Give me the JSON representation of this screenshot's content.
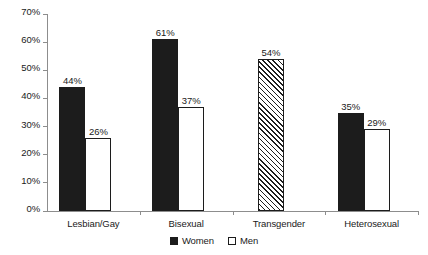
{
  "chart_data": {
    "type": "bar",
    "title": "",
    "subtitle": "",
    "xlabel": "",
    "ylabel": "",
    "categories": [
      "Lesbian/Gay",
      "Bisexual",
      "Transgender",
      "Heterosexual"
    ],
    "series": [
      {
        "name": "Women",
        "style": "filled",
        "values": [
          44,
          61,
          54,
          35
        ],
        "labels": [
          "44%",
          "61%",
          "54%",
          "35%"
        ]
      },
      {
        "name": "Men",
        "style": "outlined",
        "values": [
          26,
          37,
          null,
          29
        ],
        "labels": [
          "26%",
          "37%",
          "",
          "29%"
        ]
      }
    ],
    "bar_styles": [
      "filled",
      "filled",
      "hatched",
      "filled"
    ],
    "ylim": [
      0,
      70
    ],
    "ytick_values": [
      0,
      10,
      20,
      30,
      40,
      50,
      60,
      70
    ],
    "ytick_labels": [
      "0%",
      "10%",
      "20%",
      "30%",
      "40%",
      "50%",
      "60%",
      "70%"
    ],
    "grid": false,
    "legend_position": "bottom-center",
    "legend": [
      {
        "label": "Women",
        "style": "filled"
      },
      {
        "label": "Men",
        "style": "outlined"
      }
    ],
    "colors": {
      "bar_fill": "#1c1c1c",
      "bar_outline": "#1c1c1c",
      "axis": "#8d8d8d",
      "text": "#1a1a1a",
      "background": "#ffffff"
    }
  }
}
